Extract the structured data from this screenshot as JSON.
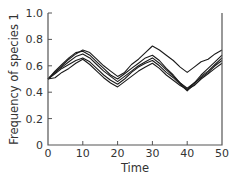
{
  "chart_data": {
    "type": "line",
    "title": "",
    "xlabel": "Time",
    "ylabel": "Frequency of species 1",
    "xlim": [
      0,
      50
    ],
    "ylim": [
      0,
      1.0
    ],
    "xticks": [
      "0",
      "10",
      "20",
      "30",
      "40",
      "50"
    ],
    "yticks": [
      "0",
      "0.2",
      "0.4",
      "0.6",
      "0.8",
      "1.0"
    ],
    "grid": false,
    "legend": null,
    "x": [
      0,
      2,
      4,
      6,
      8,
      10,
      12,
      14,
      16,
      18,
      20,
      22,
      24,
      26,
      28,
      30,
      32,
      34,
      36,
      38,
      40,
      42,
      44,
      46,
      48,
      50
    ],
    "series": [
      {
        "name": "run 1",
        "values": [
          0.5,
          0.55,
          0.6,
          0.65,
          0.69,
          0.72,
          0.7,
          0.65,
          0.6,
          0.56,
          0.52,
          0.55,
          0.61,
          0.65,
          0.7,
          0.75,
          0.72,
          0.68,
          0.64,
          0.59,
          0.55,
          0.59,
          0.63,
          0.65,
          0.69,
          0.72
        ]
      },
      {
        "name": "run 2",
        "values": [
          0.5,
          0.56,
          0.61,
          0.66,
          0.7,
          0.71,
          0.68,
          0.63,
          0.58,
          0.53,
          0.5,
          0.54,
          0.58,
          0.62,
          0.66,
          0.68,
          0.64,
          0.58,
          0.53,
          0.47,
          0.42,
          0.47,
          0.53,
          0.58,
          0.63,
          0.68
        ]
      },
      {
        "name": "run 3",
        "values": [
          0.5,
          0.55,
          0.59,
          0.63,
          0.67,
          0.69,
          0.66,
          0.61,
          0.56,
          0.52,
          0.48,
          0.52,
          0.56,
          0.6,
          0.63,
          0.66,
          0.62,
          0.57,
          0.52,
          0.47,
          0.43,
          0.47,
          0.51,
          0.55,
          0.6,
          0.64
        ]
      },
      {
        "name": "run 4",
        "values": [
          0.5,
          0.54,
          0.58,
          0.61,
          0.64,
          0.66,
          0.63,
          0.58,
          0.53,
          0.49,
          0.46,
          0.5,
          0.55,
          0.59,
          0.62,
          0.64,
          0.6,
          0.55,
          0.51,
          0.46,
          0.41,
          0.46,
          0.52,
          0.56,
          0.61,
          0.66
        ]
      },
      {
        "name": "run 5",
        "values": [
          0.5,
          0.51,
          0.55,
          0.58,
          0.62,
          0.65,
          0.61,
          0.56,
          0.51,
          0.47,
          0.44,
          0.48,
          0.52,
          0.56,
          0.59,
          0.62,
          0.58,
          0.53,
          0.49,
          0.45,
          0.42,
          0.45,
          0.5,
          0.54,
          0.58,
          0.62
        ]
      }
    ]
  },
  "axes": {
    "xlabel": "Time",
    "ylabel": "Frequency of species 1"
  }
}
